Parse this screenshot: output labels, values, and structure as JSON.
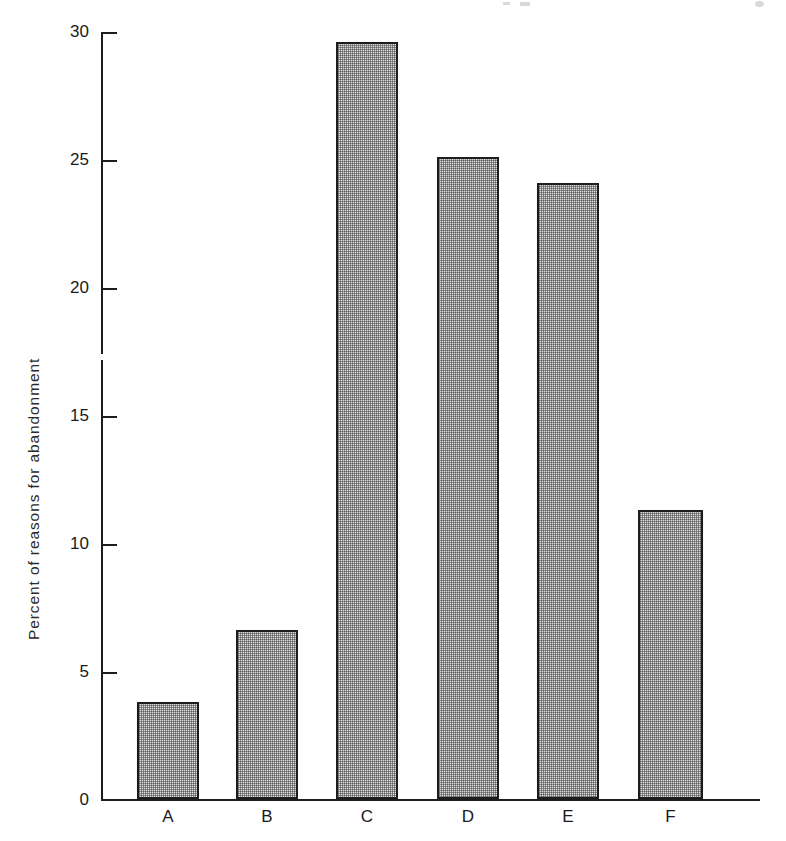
{
  "chart_data": {
    "type": "bar",
    "title": "",
    "xlabel": "",
    "ylabel": "Percent of reasons for abandonment",
    "categories": [
      "A",
      "B",
      "C",
      "D",
      "E",
      "F"
    ],
    "values": [
      3.8,
      6.6,
      29.6,
      25.1,
      24.1,
      11.3
    ],
    "ylim": [
      0,
      30
    ],
    "yticks": [
      0,
      5,
      10,
      15,
      20,
      25,
      30
    ],
    "ytick_labels": [
      "0",
      "5",
      "10",
      "15",
      "20",
      "25",
      "30"
    ],
    "grid": false,
    "legend": null,
    "bar_fill": "#dedede",
    "bar_edge": "#1d1d1d",
    "bar_hatch": "fine-checkerboard-halftone",
    "axis_color": "#1d1d1d",
    "background": "#ffffff"
  },
  "axis": {
    "y_title": "Percent of reasons for abandonment",
    "ticks": [
      {
        "label": "30",
        "value": 30
      },
      {
        "label": "25",
        "value": 25
      },
      {
        "label": "20",
        "value": 20
      },
      {
        "label": "15",
        "value": 15
      },
      {
        "label": "10",
        "value": 10
      },
      {
        "label": "5",
        "value": 5
      },
      {
        "label": "0",
        "value": 0
      }
    ]
  },
  "bars": [
    {
      "label": "A",
      "value": 3.8
    },
    {
      "label": "B",
      "value": 6.6
    },
    {
      "label": "C",
      "value": 29.6
    },
    {
      "label": "D",
      "value": 25.1
    },
    {
      "label": "E",
      "value": 24.1
    },
    {
      "label": "F",
      "value": 11.3
    }
  ]
}
